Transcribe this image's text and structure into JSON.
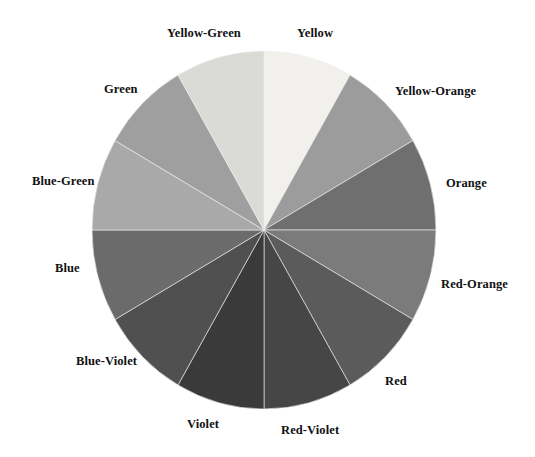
{
  "figure": {
    "name": "color-wheel",
    "type": "pie",
    "background": "#ffffff",
    "center": {
      "x": 264,
      "y": 230
    },
    "radius": {
      "rx": 172,
      "ry": 179
    },
    "segment_count": 12,
    "segment_sweep_degrees": 30,
    "start_angle_degrees": -90,
    "stroke": "#f2f2f2",
    "stroke_width": 0.6
  },
  "chart_data": {
    "type": "pie",
    "title": "",
    "subtitle": "",
    "xlabel": "",
    "ylabel": "",
    "legend_position": "outside-radial",
    "grid": false,
    "categories": [
      "Yellow",
      "Yellow-Orange",
      "Orange",
      "Red-Orange",
      "Red",
      "Red-Violet",
      "Violet",
      "Blue-Violet",
      "Blue",
      "Blue-Green",
      "Green",
      "Yellow-Green"
    ],
    "values": [
      30,
      30,
      30,
      30,
      30,
      30,
      30,
      30,
      30,
      30,
      30,
      30
    ],
    "value_unit": "degrees",
    "colors": [
      "#f1f0ec",
      "#9c9c9c",
      "#6f6f6f",
      "#7b7b7b",
      "#5b5b5b",
      "#464646",
      "#3a3a3a",
      "#505050",
      "#6b6b6b",
      "#a9a9a9",
      "#9f9f9f",
      "#dadad6"
    ],
    "annotations": []
  },
  "labels": [
    {
      "id": "yellow",
      "text": "Yellow",
      "swatch": "#f1f0ec",
      "angle_deg": 15,
      "position": "top-right"
    },
    {
      "id": "yellow-green",
      "text": "Yellow-Green",
      "swatch": "#dadad6",
      "angle_deg": 345,
      "position": "top-left"
    },
    {
      "id": "green",
      "text": "Green",
      "swatch": "#9f9f9f",
      "angle_deg": 315,
      "position": "upper-left"
    },
    {
      "id": "blue-green",
      "text": "Blue-Green",
      "swatch": "#a9a9a9",
      "angle_deg": 285,
      "position": "left-upper"
    },
    {
      "id": "blue",
      "text": "Blue",
      "swatch": "#6b6b6b",
      "angle_deg": 255,
      "position": "left-lower"
    },
    {
      "id": "blue-violet",
      "text": "Blue-Violet",
      "swatch": "#505050",
      "angle_deg": 225,
      "position": "lower-left"
    },
    {
      "id": "violet",
      "text": "Violet",
      "swatch": "#3a3a3a",
      "angle_deg": 195,
      "position": "bottom-left"
    },
    {
      "id": "red-violet",
      "text": "Red-Violet",
      "swatch": "#464646",
      "angle_deg": 165,
      "position": "bottom-right"
    },
    {
      "id": "red",
      "text": "Red",
      "swatch": "#5b5b5b",
      "angle_deg": 135,
      "position": "lower-right"
    },
    {
      "id": "red-orange",
      "text": "Red-Orange",
      "swatch": "#7b7b7b",
      "angle_deg": 105,
      "position": "right-lower"
    },
    {
      "id": "orange",
      "text": "Orange",
      "swatch": "#6f6f6f",
      "angle_deg": 75,
      "position": "right-upper"
    },
    {
      "id": "yellow-orange",
      "text": "Yellow-Orange",
      "swatch": "#9c9c9c",
      "angle_deg": 45,
      "position": "upper-right"
    }
  ]
}
